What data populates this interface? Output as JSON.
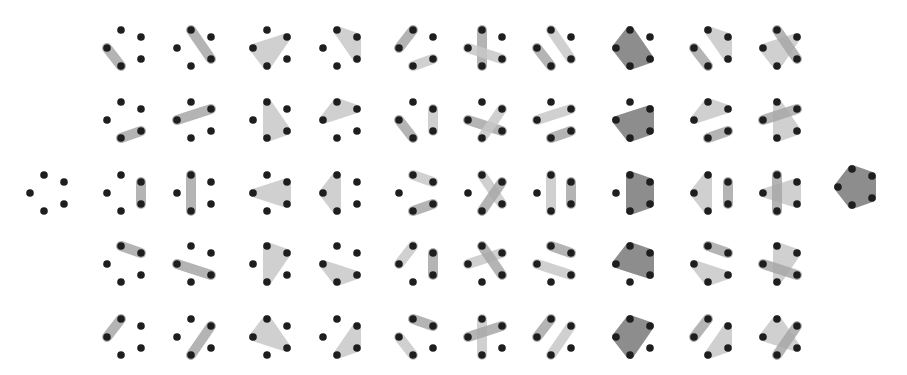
{
  "figure": {
    "title": "",
    "colors": {
      "background": "#ffffff",
      "dot": "#1e1e1e",
      "shade_light": "#c8c8c8",
      "shade_mid": "#a8a8a8",
      "shade_dark": "#7a7a7a"
    },
    "point_offsets": {
      "L": [
        0,
        0
      ],
      "T": [
        14,
        -18
      ],
      "TR": [
        34,
        -11
      ],
      "BR": [
        34,
        11
      ],
      "B": [
        14,
        18
      ]
    },
    "columns_x": [
      107,
      177,
      253,
      323,
      399,
      468,
      537,
      616,
      694,
      763
    ],
    "rows_y": [
      48,
      120,
      193,
      264,
      337
    ],
    "left_cell": {
      "x": 30,
      "y": 193,
      "shapes": []
    },
    "right_cell": {
      "x": 838,
      "y": 187,
      "shapes": [
        {
          "pts": [
            "L",
            "T",
            "TR",
            "BR",
            "B"
          ],
          "tone": "dark"
        }
      ]
    },
    "grid": [
      [
        [
          {
            "pts": [
              "L",
              "B"
            ],
            "tone": "mid"
          }
        ],
        [
          {
            "pts": [
              "T",
              "BR"
            ],
            "tone": "mid"
          }
        ],
        [
          {
            "pts": [
              "L",
              "TR",
              "B"
            ],
            "tone": "light"
          }
        ],
        [
          {
            "pts": [
              "T",
              "TR",
              "BR"
            ],
            "tone": "light"
          }
        ],
        [
          {
            "pts": [
              "L",
              "T"
            ],
            "tone": "mid"
          },
          {
            "pts": [
              "B",
              "BR"
            ],
            "tone": "light"
          }
        ],
        [
          {
            "pts": [
              "T",
              "B"
            ],
            "tone": "mid"
          },
          {
            "pts": [
              "L",
              "BR"
            ],
            "tone": "light"
          }
        ],
        [
          {
            "pts": [
              "L",
              "B"
            ],
            "tone": "mid"
          },
          {
            "pts": [
              "T",
              "BR"
            ],
            "tone": "light"
          }
        ],
        [
          {
            "pts": [
              "L",
              "T",
              "BR",
              "B"
            ],
            "tone": "dark"
          }
        ],
        [
          {
            "pts": [
              "T",
              "TR",
              "BR"
            ],
            "tone": "light"
          },
          {
            "pts": [
              "L",
              "B"
            ],
            "tone": "mid"
          }
        ],
        [
          {
            "pts": [
              "L",
              "TR",
              "B"
            ],
            "tone": "light"
          },
          {
            "pts": [
              "T",
              "BR"
            ],
            "tone": "mid"
          }
        ]
      ],
      [
        [
          {
            "pts": [
              "B",
              "BR"
            ],
            "tone": "mid"
          }
        ],
        [
          {
            "pts": [
              "L",
              "TR"
            ],
            "tone": "mid"
          }
        ],
        [
          {
            "pts": [
              "T",
              "BR",
              "B"
            ],
            "tone": "light"
          }
        ],
        [
          {
            "pts": [
              "L",
              "T",
              "TR"
            ],
            "tone": "light"
          }
        ],
        [
          {
            "pts": [
              "L",
              "B"
            ],
            "tone": "mid"
          },
          {
            "pts": [
              "TR",
              "BR"
            ],
            "tone": "light"
          }
        ],
        [
          {
            "pts": [
              "L",
              "BR"
            ],
            "tone": "mid"
          },
          {
            "pts": [
              "TR",
              "B"
            ],
            "tone": "light"
          }
        ],
        [
          {
            "pts": [
              "L",
              "TR"
            ],
            "tone": "light"
          },
          {
            "pts": [
              "B",
              "BR"
            ],
            "tone": "mid"
          }
        ],
        [
          {
            "pts": [
              "L",
              "TR",
              "BR",
              "B"
            ],
            "tone": "dark"
          }
        ],
        [
          {
            "pts": [
              "L",
              "T",
              "TR"
            ],
            "tone": "light"
          },
          {
            "pts": [
              "B",
              "BR"
            ],
            "tone": "mid"
          }
        ],
        [
          {
            "pts": [
              "T",
              "BR",
              "B"
            ],
            "tone": "light"
          },
          {
            "pts": [
              "L",
              "TR"
            ],
            "tone": "mid"
          }
        ]
      ],
      [
        [
          {
            "pts": [
              "TR",
              "BR"
            ],
            "tone": "mid"
          }
        ],
        [
          {
            "pts": [
              "T",
              "B"
            ],
            "tone": "mid"
          }
        ],
        [
          {
            "pts": [
              "L",
              "TR",
              "BR"
            ],
            "tone": "light"
          }
        ],
        [
          {
            "pts": [
              "L",
              "T",
              "B"
            ],
            "tone": "light"
          }
        ],
        [
          {
            "pts": [
              "T",
              "TR"
            ],
            "tone": "light"
          },
          {
            "pts": [
              "B",
              "BR"
            ],
            "tone": "mid"
          }
        ],
        [
          {
            "pts": [
              "T",
              "BR"
            ],
            "tone": "light"
          },
          {
            "pts": [
              "TR",
              "B"
            ],
            "tone": "mid"
          }
        ],
        [
          {
            "pts": [
              "T",
              "B"
            ],
            "tone": "light"
          },
          {
            "pts": [
              "TR",
              "BR"
            ],
            "tone": "mid"
          }
        ],
        [
          {
            "pts": [
              "T",
              "TR",
              "BR",
              "B"
            ],
            "tone": "dark"
          }
        ],
        [
          {
            "pts": [
              "L",
              "T",
              "B"
            ],
            "tone": "light"
          },
          {
            "pts": [
              "TR",
              "BR"
            ],
            "tone": "mid"
          }
        ],
        [
          {
            "pts": [
              "L",
              "TR",
              "BR"
            ],
            "tone": "light"
          },
          {
            "pts": [
              "T",
              "B"
            ],
            "tone": "mid"
          }
        ]
      ],
      [
        [
          {
            "pts": [
              "T",
              "TR"
            ],
            "tone": "mid"
          }
        ],
        [
          {
            "pts": [
              "L",
              "BR"
            ],
            "tone": "mid"
          }
        ],
        [
          {
            "pts": [
              "T",
              "TR",
              "B"
            ],
            "tone": "light"
          }
        ],
        [
          {
            "pts": [
              "L",
              "BR",
              "B"
            ],
            "tone": "light"
          }
        ],
        [
          {
            "pts": [
              "L",
              "T"
            ],
            "tone": "light"
          },
          {
            "pts": [
              "TR",
              "BR"
            ],
            "tone": "mid"
          }
        ],
        [
          {
            "pts": [
              "L",
              "TR"
            ],
            "tone": "light"
          },
          {
            "pts": [
              "T",
              "BR"
            ],
            "tone": "mid"
          }
        ],
        [
          {
            "pts": [
              "T",
              "TR"
            ],
            "tone": "mid"
          },
          {
            "pts": [
              "L",
              "BR"
            ],
            "tone": "light"
          }
        ],
        [
          {
            "pts": [
              "L",
              "T",
              "TR",
              "BR"
            ],
            "tone": "dark"
          }
        ],
        [
          {
            "pts": [
              "L",
              "BR",
              "B"
            ],
            "tone": "light"
          },
          {
            "pts": [
              "T",
              "TR"
            ],
            "tone": "mid"
          }
        ],
        [
          {
            "pts": [
              "T",
              "TR",
              "B"
            ],
            "tone": "light"
          },
          {
            "pts": [
              "L",
              "BR"
            ],
            "tone": "mid"
          }
        ]
      ],
      [
        [
          {
            "pts": [
              "L",
              "T"
            ],
            "tone": "mid"
          }
        ],
        [
          {
            "pts": [
              "TR",
              "B"
            ],
            "tone": "mid"
          }
        ],
        [
          {
            "pts": [
              "L",
              "T",
              "BR"
            ],
            "tone": "light"
          }
        ],
        [
          {
            "pts": [
              "TR",
              "BR",
              "B"
            ],
            "tone": "light"
          }
        ],
        [
          {
            "pts": [
              "T",
              "TR"
            ],
            "tone": "mid"
          },
          {
            "pts": [
              "L",
              "B"
            ],
            "tone": "light"
          }
        ],
        [
          {
            "pts": [
              "T",
              "B"
            ],
            "tone": "light"
          },
          {
            "pts": [
              "L",
              "TR"
            ],
            "tone": "mid"
          }
        ],
        [
          {
            "pts": [
              "L",
              "T"
            ],
            "tone": "mid"
          },
          {
            "pts": [
              "TR",
              "B"
            ],
            "tone": "light"
          }
        ],
        [
          {
            "pts": [
              "L",
              "T",
              "TR",
              "B"
            ],
            "tone": "dark"
          }
        ],
        [
          {
            "pts": [
              "TR",
              "BR",
              "B"
            ],
            "tone": "light"
          },
          {
            "pts": [
              "L",
              "T"
            ],
            "tone": "mid"
          }
        ],
        [
          {
            "pts": [
              "L",
              "T",
              "BR"
            ],
            "tone": "light"
          },
          {
            "pts": [
              "TR",
              "B"
            ],
            "tone": "mid"
          }
        ]
      ]
    ]
  }
}
